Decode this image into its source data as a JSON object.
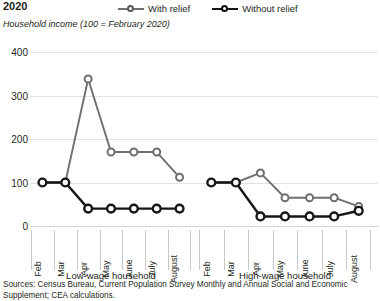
{
  "header": {
    "title": "2020",
    "subtitle": "Household income (100 = February 2020)"
  },
  "legend": {
    "position": "top",
    "items": [
      {
        "label": "With relief",
        "color": "#6f6f6f",
        "marker": "circle-open"
      },
      {
        "label": "Without relief",
        "color": "#161616",
        "marker": "circle-open"
      }
    ]
  },
  "source": {
    "line1": "Sources: Census Bureau, Current Population Survey Monthly and Annual Social and Economic",
    "line2": "Supplement; CEA calculations."
  },
  "chart_data": {
    "type": "line",
    "title": "2020",
    "subtitle": "Household income (100 = February 2020)",
    "xlabel": "",
    "ylabel": "Household income (100 = February 2020)",
    "ylim": [
      0,
      400
    ],
    "yticks": [
      0,
      100,
      200,
      300,
      400
    ],
    "grid": true,
    "legend_position": "top",
    "categories": [
      "Feb",
      "Mar",
      "Apr",
      "May",
      "June",
      "July",
      "August"
    ],
    "panels": [
      {
        "name": "Low-wage household",
        "series": [
          {
            "name": "With relief",
            "color": "#6f6f6f",
            "values": [
              100,
              100,
              338,
              170,
              170,
              170,
              112
            ]
          },
          {
            "name": "Without relief",
            "color": "#161616",
            "values": [
              100,
              100,
              40,
              40,
              40,
              40,
              40
            ]
          }
        ]
      },
      {
        "name": "High-wage household",
        "series": [
          {
            "name": "With relief",
            "color": "#6f6f6f",
            "values": [
              100,
              100,
              122,
              65,
              65,
              65,
              45
            ]
          },
          {
            "name": "Without relief",
            "color": "#161616",
            "values": [
              100,
              100,
              22,
              22,
              22,
              22,
              35
            ]
          }
        ]
      }
    ]
  }
}
